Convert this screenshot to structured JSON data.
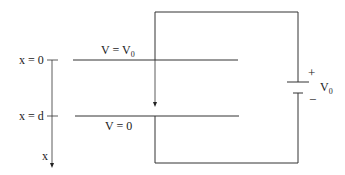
{
  "diagram": {
    "type": "parallel-plate capacitor circuit",
    "labels": {
      "x_zero": "x = 0",
      "x_d": "x = d",
      "x_axis": "x",
      "top_plate_v": "V = V",
      "top_plate_v_sub": "0",
      "bottom_plate_v": "V = 0",
      "battery_plus": "+",
      "battery_minus": "−",
      "battery_v": "V",
      "battery_v_sub": "0"
    },
    "colors": {
      "line": "#333333",
      "background": "#ffffff"
    }
  }
}
